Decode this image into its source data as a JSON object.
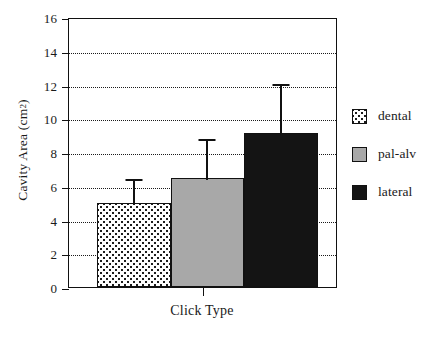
{
  "chart_data": {
    "type": "bar",
    "title": "",
    "xlabel": "Click Type",
    "ylabel": "Cavity Area (cm",
    "ylabel_sup": "2",
    "ylabel_tail": ")",
    "categories": [
      "dental",
      "pal-alv",
      "lateral"
    ],
    "values": [
      4.95,
      6.45,
      9.15
    ],
    "error_upper": [
      1.55,
      2.45,
      3.0
    ],
    "error_tops": [
      6.5,
      8.9,
      12.15
    ],
    "ylim": [
      0,
      16
    ],
    "yticks": [
      0,
      2,
      4,
      6,
      8,
      10,
      12,
      14,
      16
    ],
    "ytick_labels": [
      "0",
      "2",
      "4",
      "6",
      "8",
      "10",
      "12",
      "14",
      "16"
    ],
    "gridlines": [
      2,
      4,
      6,
      8,
      10,
      12,
      14
    ],
    "grid": true,
    "grid_style": "dotted",
    "legend_position": "right",
    "series": [
      {
        "name": "dental",
        "value": 4.95,
        "error_upper": 1.55,
        "fill": "stipple",
        "color": "#ffffff"
      },
      {
        "name": "pal-alv",
        "value": 6.45,
        "error_upper": 2.45,
        "fill": "solid",
        "color": "#a8a8a8"
      },
      {
        "name": "lateral",
        "value": 9.15,
        "error_upper": 3.0,
        "fill": "solid",
        "color": "#141414"
      }
    ]
  },
  "legend": {
    "items": [
      {
        "label": "dental",
        "swatch": "stipple-swatch"
      },
      {
        "label": "pal-alv",
        "swatch": "gray-swatch"
      },
      {
        "label": "lateral",
        "swatch": "black-swatch"
      }
    ]
  },
  "colors": {
    "axis": "#111111",
    "grid": "#1b1b1b",
    "dental": "#ffffff",
    "pal_alv": "#a8a8a8",
    "lateral": "#141414",
    "background": "#ffffff"
  }
}
